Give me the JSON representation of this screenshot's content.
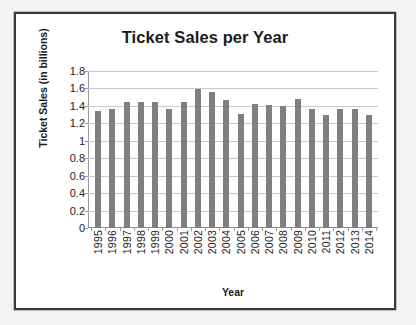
{
  "chart_data": {
    "type": "bar",
    "title": "Ticket Sales per Year",
    "xlabel": "Year",
    "ylabel": "Ticket Sales (in billions)",
    "categories": [
      "1995",
      "1996",
      "1997",
      "1998",
      "1999",
      "2000",
      "2001",
      "2002",
      "2003",
      "2004",
      "2005",
      "2006",
      "2007",
      "2008",
      "2009",
      "2010",
      "2011",
      "2012",
      "2013",
      "2014"
    ],
    "values": [
      1.34,
      1.37,
      1.45,
      1.44,
      1.44,
      1.37,
      1.44,
      1.59,
      1.56,
      1.47,
      1.31,
      1.42,
      1.41,
      1.4,
      1.48,
      1.36,
      1.3,
      1.36,
      1.36,
      1.3
    ],
    "ylim": [
      0,
      1.8
    ],
    "ytick_labels": [
      "1.8",
      "1.6",
      "1.4",
      "1.2",
      "1",
      "0.8",
      "0.6",
      "0.4",
      "0.2",
      "0"
    ],
    "ytick_values": [
      1.8,
      1.6,
      1.4,
      1.2,
      1.0,
      0.8,
      0.6,
      0.4,
      0.2,
      0
    ],
    "grid": true,
    "legend": false,
    "bar_color": "#7f7f7f",
    "gridline_color": "#c9c9c9",
    "axis_color": "#9a9a9a",
    "text_color": "#1b1b1b"
  }
}
